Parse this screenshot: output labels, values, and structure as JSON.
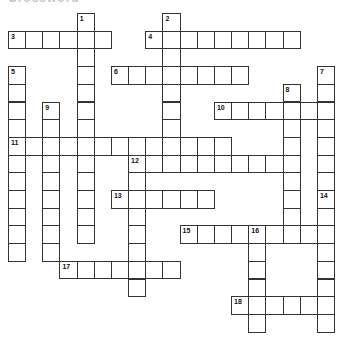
{
  "heading": "Crossword",
  "grid": {
    "origin_x": 8,
    "origin_y": 13,
    "cell_w": 17.16,
    "cell_h": 17.7,
    "border_color": "#333333"
  },
  "entries": [
    {
      "number": 1,
      "direction": "down",
      "row": 0,
      "col": 4,
      "length": 13
    },
    {
      "number": 2,
      "direction": "down",
      "row": 0,
      "col": 9,
      "length": 9
    },
    {
      "number": 3,
      "direction": "across",
      "row": 1,
      "col": 0,
      "length": 6
    },
    {
      "number": 4,
      "direction": "across",
      "row": 1,
      "col": 8,
      "length": 9
    },
    {
      "number": 5,
      "direction": "down",
      "row": 3,
      "col": 0,
      "length": 11
    },
    {
      "number": 6,
      "direction": "across",
      "row": 3,
      "col": 6,
      "length": 8
    },
    {
      "number": 7,
      "direction": "down",
      "row": 3,
      "col": 18,
      "length": 7
    },
    {
      "number": 8,
      "direction": "down",
      "row": 4,
      "col": 16,
      "length": 9
    },
    {
      "number": 9,
      "direction": "down",
      "row": 5,
      "col": 2,
      "length": 9
    },
    {
      "number": 10,
      "direction": "across",
      "row": 5,
      "col": 12,
      "length": 7
    },
    {
      "number": 11,
      "direction": "across",
      "row": 7,
      "col": 0,
      "length": 13
    },
    {
      "number": 12,
      "direction": "across",
      "row": 8,
      "col": 7,
      "length": 10
    },
    {
      "number": 12,
      "direction": "down",
      "row": 8,
      "col": 7,
      "length": 8
    },
    {
      "number": 13,
      "direction": "across",
      "row": 10,
      "col": 6,
      "length": 6
    },
    {
      "number": 14,
      "direction": "down",
      "row": 10,
      "col": 18,
      "length": 8
    },
    {
      "number": 15,
      "direction": "across",
      "row": 12,
      "col": 10,
      "length": 9
    },
    {
      "number": 16,
      "direction": "down",
      "row": 12,
      "col": 14,
      "length": 6
    },
    {
      "number": 17,
      "direction": "across",
      "row": 14,
      "col": 3,
      "length": 7
    },
    {
      "number": 18,
      "direction": "across",
      "row": 16,
      "col": 13,
      "length": 6
    }
  ]
}
